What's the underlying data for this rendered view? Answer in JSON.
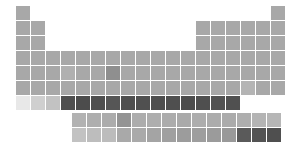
{
  "chart_data": {
    "type": "heatmap",
    "title": "",
    "subtitle": "",
    "xlabel": "",
    "ylabel": "",
    "legend": [],
    "grid": false,
    "layout": {
      "origin_x": 16,
      "origin_y": 6,
      "cell_size": 14,
      "pitch_x": 15,
      "pitch_y": 15,
      "fblock_origin_x": 72,
      "fblock_origin_y": 113,
      "groups": 18,
      "periods": 7,
      "fblock_columns": 14
    },
    "color_scale": {
      "type": "sequential-gray",
      "low": "#eeeeee",
      "mid": "#a8a8a8",
      "high": "#4d4d4d",
      "stops": [
        "#eeeeee",
        "#e2e2e2",
        "#d2d2d2",
        "#c6c6c6",
        "#b4b4b4",
        "#a8a8a8",
        "#9a9a9a",
        "#8a8a8a",
        "#6e6e6e",
        "#5a5a5a",
        "#4d4d4d"
      ]
    },
    "cells": [
      {
        "group": 1,
        "period": 1,
        "color": "#a8a8a8"
      },
      {
        "group": 18,
        "period": 1,
        "color": "#a8a8a8"
      },
      {
        "group": 1,
        "period": 2,
        "color": "#a8a8a8"
      },
      {
        "group": 2,
        "period": 2,
        "color": "#a8a8a8"
      },
      {
        "group": 13,
        "period": 2,
        "color": "#a8a8a8"
      },
      {
        "group": 14,
        "period": 2,
        "color": "#a8a8a8"
      },
      {
        "group": 15,
        "period": 2,
        "color": "#a8a8a8"
      },
      {
        "group": 16,
        "period": 2,
        "color": "#a8a8a8"
      },
      {
        "group": 17,
        "period": 2,
        "color": "#a8a8a8"
      },
      {
        "group": 18,
        "period": 2,
        "color": "#a8a8a8"
      },
      {
        "group": 1,
        "period": 3,
        "color": "#a8a8a8"
      },
      {
        "group": 2,
        "period": 3,
        "color": "#a8a8a8"
      },
      {
        "group": 13,
        "period": 3,
        "color": "#a8a8a8"
      },
      {
        "group": 14,
        "period": 3,
        "color": "#a8a8a8"
      },
      {
        "group": 15,
        "period": 3,
        "color": "#a8a8a8"
      },
      {
        "group": 16,
        "period": 3,
        "color": "#a8a8a8"
      },
      {
        "group": 17,
        "period": 3,
        "color": "#a8a8a8"
      },
      {
        "group": 18,
        "period": 3,
        "color": "#a8a8a8"
      },
      {
        "group": 1,
        "period": 4,
        "color": "#a8a8a8"
      },
      {
        "group": 2,
        "period": 4,
        "color": "#a8a8a8"
      },
      {
        "group": 3,
        "period": 4,
        "color": "#a8a8a8"
      },
      {
        "group": 4,
        "period": 4,
        "color": "#a8a8a8"
      },
      {
        "group": 5,
        "period": 4,
        "color": "#a8a8a8"
      },
      {
        "group": 6,
        "period": 4,
        "color": "#a8a8a8"
      },
      {
        "group": 7,
        "period": 4,
        "color": "#a8a8a8"
      },
      {
        "group": 8,
        "period": 4,
        "color": "#a8a8a8"
      },
      {
        "group": 9,
        "period": 4,
        "color": "#a8a8a8"
      },
      {
        "group": 10,
        "period": 4,
        "color": "#a8a8a8"
      },
      {
        "group": 11,
        "period": 4,
        "color": "#a8a8a8"
      },
      {
        "group": 12,
        "period": 4,
        "color": "#a8a8a8"
      },
      {
        "group": 13,
        "period": 4,
        "color": "#a8a8a8"
      },
      {
        "group": 14,
        "period": 4,
        "color": "#a8a8a8"
      },
      {
        "group": 15,
        "period": 4,
        "color": "#a8a8a8"
      },
      {
        "group": 16,
        "period": 4,
        "color": "#a8a8a8"
      },
      {
        "group": 17,
        "period": 4,
        "color": "#a8a8a8"
      },
      {
        "group": 18,
        "period": 4,
        "color": "#a8a8a8"
      },
      {
        "group": 1,
        "period": 5,
        "color": "#a8a8a8"
      },
      {
        "group": 2,
        "period": 5,
        "color": "#a8a8a8"
      },
      {
        "group": 3,
        "period": 5,
        "color": "#a8a8a8"
      },
      {
        "group": 4,
        "period": 5,
        "color": "#b0b0b0"
      },
      {
        "group": 5,
        "period": 5,
        "color": "#a8a8a8"
      },
      {
        "group": 6,
        "period": 5,
        "color": "#a8a8a8"
      },
      {
        "group": 7,
        "period": 5,
        "color": "#8f8f8f"
      },
      {
        "group": 8,
        "period": 5,
        "color": "#a8a8a8"
      },
      {
        "group": 9,
        "period": 5,
        "color": "#a8a8a8"
      },
      {
        "group": 10,
        "period": 5,
        "color": "#a8a8a8"
      },
      {
        "group": 11,
        "period": 5,
        "color": "#a8a8a8"
      },
      {
        "group": 12,
        "period": 5,
        "color": "#a8a8a8"
      },
      {
        "group": 13,
        "period": 5,
        "color": "#a8a8a8"
      },
      {
        "group": 14,
        "period": 5,
        "color": "#a8a8a8"
      },
      {
        "group": 15,
        "period": 5,
        "color": "#a8a8a8"
      },
      {
        "group": 16,
        "period": 5,
        "color": "#a8a8a8"
      },
      {
        "group": 17,
        "period": 5,
        "color": "#a8a8a8"
      },
      {
        "group": 18,
        "period": 5,
        "color": "#a8a8a8"
      },
      {
        "group": 1,
        "period": 6,
        "color": "#a8a8a8"
      },
      {
        "group": 2,
        "period": 6,
        "color": "#a8a8a8"
      },
      {
        "group": 3,
        "period": 6,
        "color": "#a8a8a8"
      },
      {
        "group": 4,
        "period": 6,
        "color": "#a8a8a8"
      },
      {
        "group": 5,
        "period": 6,
        "color": "#a8a8a8"
      },
      {
        "group": 6,
        "period": 6,
        "color": "#a8a8a8"
      },
      {
        "group": 7,
        "period": 6,
        "color": "#a8a8a8"
      },
      {
        "group": 8,
        "period": 6,
        "color": "#a8a8a8"
      },
      {
        "group": 9,
        "period": 6,
        "color": "#a8a8a8"
      },
      {
        "group": 10,
        "period": 6,
        "color": "#a8a8a8"
      },
      {
        "group": 11,
        "period": 6,
        "color": "#a8a8a8"
      },
      {
        "group": 12,
        "period": 6,
        "color": "#a8a8a8"
      },
      {
        "group": 13,
        "period": 6,
        "color": "#a8a8a8"
      },
      {
        "group": 14,
        "period": 6,
        "color": "#a8a8a8"
      },
      {
        "group": 15,
        "period": 6,
        "color": "#a8a8a8"
      },
      {
        "group": 16,
        "period": 6,
        "color": "#b4b4b4"
      },
      {
        "group": 17,
        "period": 6,
        "color": "#a8a8a8"
      },
      {
        "group": 18,
        "period": 6,
        "color": "#a8a8a8"
      },
      {
        "group": 1,
        "period": 7,
        "color": "#e8e8e8"
      },
      {
        "group": 2,
        "period": 7,
        "color": "#cfcfcf"
      },
      {
        "group": 3,
        "period": 7,
        "color": "#c2c2c2"
      },
      {
        "group": 4,
        "period": 7,
        "color": "#4f4f4f"
      },
      {
        "group": 5,
        "period": 7,
        "color": "#4c4c4c"
      },
      {
        "group": 6,
        "period": 7,
        "color": "#4f4f4f"
      },
      {
        "group": 7,
        "period": 7,
        "color": "#565656"
      },
      {
        "group": 8,
        "period": 7,
        "color": "#4f4f4f"
      },
      {
        "group": 9,
        "period": 7,
        "color": "#505050"
      },
      {
        "group": 10,
        "period": 7,
        "color": "#4e4e4e"
      },
      {
        "group": 11,
        "period": 7,
        "color": "#4f4f4f"
      },
      {
        "group": 12,
        "period": 7,
        "color": "#4d4d4d"
      },
      {
        "group": 13,
        "period": 7,
        "color": "#4f4f4f"
      },
      {
        "group": 14,
        "period": 7,
        "color": "#525252"
      },
      {
        "group": 15,
        "period": 7,
        "color": "#505050"
      }
    ],
    "fblock_cells": [
      {
        "column": 1,
        "row": 1,
        "color": "#b2b2b2"
      },
      {
        "column": 2,
        "row": 1,
        "color": "#aeaeae"
      },
      {
        "column": 3,
        "row": 1,
        "color": "#acacac"
      },
      {
        "column": 4,
        "row": 1,
        "color": "#949494"
      },
      {
        "column": 5,
        "row": 1,
        "color": "#adadad"
      },
      {
        "column": 6,
        "row": 1,
        "color": "#aeaeae"
      },
      {
        "column": 7,
        "row": 1,
        "color": "#acacac"
      },
      {
        "column": 8,
        "row": 1,
        "color": "#aaaaaa"
      },
      {
        "column": 9,
        "row": 1,
        "color": "#adadad"
      },
      {
        "column": 10,
        "row": 1,
        "color": "#acacac"
      },
      {
        "column": 11,
        "row": 1,
        "color": "#ababab"
      },
      {
        "column": 12,
        "row": 1,
        "color": "#aeaeae"
      },
      {
        "column": 13,
        "row": 1,
        "color": "#b4b4b4"
      },
      {
        "column": 14,
        "row": 1,
        "color": "#b6b6b6"
      },
      {
        "column": 1,
        "row": 2,
        "color": "#c2c2c2"
      },
      {
        "column": 2,
        "row": 2,
        "color": "#bdbdbd"
      },
      {
        "column": 3,
        "row": 2,
        "color": "#bcbcbc"
      },
      {
        "column": 4,
        "row": 2,
        "color": "#a9a9a9"
      },
      {
        "column": 5,
        "row": 2,
        "color": "#aaaaaa"
      },
      {
        "column": 6,
        "row": 2,
        "color": "#a4a4a4"
      },
      {
        "column": 7,
        "row": 2,
        "color": "#a0a0a0"
      },
      {
        "column": 8,
        "row": 2,
        "color": "#9c9c9c"
      },
      {
        "column": 9,
        "row": 2,
        "color": "#9e9e9e"
      },
      {
        "column": 10,
        "row": 2,
        "color": "#9b9b9b"
      },
      {
        "column": 11,
        "row": 2,
        "color": "#999999"
      },
      {
        "column": 12,
        "row": 2,
        "color": "#5a5a5a"
      },
      {
        "column": 13,
        "row": 2,
        "color": "#535353"
      },
      {
        "column": 14,
        "row": 2,
        "color": "#4f4f4f"
      }
    ]
  }
}
